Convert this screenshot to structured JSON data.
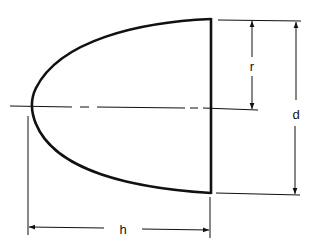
{
  "diagram": {
    "type": "technical-drawing",
    "colors": {
      "stroke": "#111111",
      "background": "#ffffff"
    },
    "labels": {
      "radius": "r",
      "diameter": "d",
      "length": "h"
    },
    "dimensions": [
      {
        "name": "r",
        "meaning": "radius from axis to top edge"
      },
      {
        "name": "d",
        "meaning": "full base diameter"
      },
      {
        "name": "h",
        "meaning": "length from tip to base"
      }
    ]
  }
}
